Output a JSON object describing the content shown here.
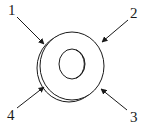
{
  "diagram": {
    "labels": [
      {
        "id": "1",
        "text": "1"
      },
      {
        "id": "2",
        "text": "2"
      },
      {
        "id": "3",
        "text": "3"
      },
      {
        "id": "4",
        "text": "4"
      }
    ],
    "colors": {
      "stroke": "#1a1a1a",
      "background": "#ffffff"
    }
  }
}
